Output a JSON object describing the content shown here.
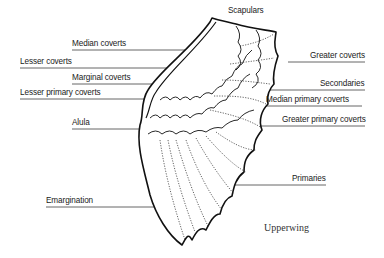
{
  "title": "Upperwing",
  "labels": {
    "scapulars": "Scapulars",
    "median_coverts": "Median coverts",
    "lesser_coverts": "Lesser coverts",
    "marginal_coverts": "Marginal coverts",
    "lesser_primary_coverts": "Lesser primary coverts",
    "alula": "Alula",
    "greater_coverts": "Greater coverts",
    "secondaries": "Secondaries",
    "median_primary_coverts": "Median primary coverts",
    "greater_primary_coverts": "Greater primary coverts",
    "primaries": "Primaries",
    "emargination": "Emargination"
  },
  "colors": {
    "line": "#555555",
    "outline": "#111111",
    "text": "#1a1a1a"
  }
}
